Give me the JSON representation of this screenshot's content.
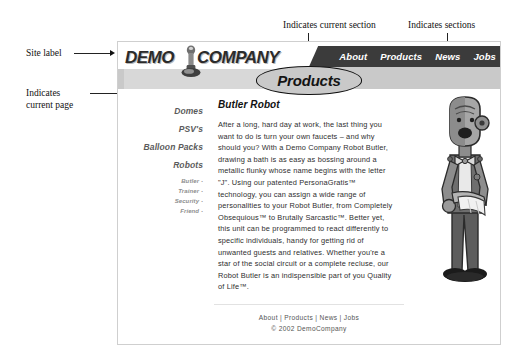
{
  "figure": {
    "annotations": [
      {
        "id": "site-label",
        "text": "Site label"
      },
      {
        "id": "current-page",
        "text": "Indicates\ncurrent page"
      },
      {
        "id": "current-section",
        "text": "Indicates current section"
      },
      {
        "id": "sections",
        "text": "Indicates sections"
      }
    ]
  },
  "site": {
    "logo": {
      "word1": "DEMO",
      "word2": "COMPANY",
      "icon": "robot-logo-icon"
    },
    "topnav": [
      {
        "label": "About",
        "current": false
      },
      {
        "label": "Products",
        "current": true
      },
      {
        "label": "News",
        "current": false
      },
      {
        "label": "Jobs",
        "current": false
      }
    ],
    "section_badge": "Products"
  },
  "sidebar": {
    "items": [
      {
        "label": "Domes",
        "level": "major"
      },
      {
        "label": "PSV's",
        "level": "major"
      },
      {
        "label": "Balloon Packs",
        "level": "major"
      },
      {
        "label": "Robots",
        "level": "major"
      }
    ],
    "subitems": [
      {
        "label": "Butler",
        "current": true
      },
      {
        "label": "Trainer",
        "current": false
      },
      {
        "label": "Security",
        "current": false
      },
      {
        "label": "Friend",
        "current": false
      }
    ]
  },
  "main": {
    "page_title": "Butler Robot",
    "body": "After a long, hard day at work, the last thing you want to do is turn your own faucets – and why should you? With a Demo Company Robot Butler, drawing a bath is as easy as bossing around a metallic flunky whose name begins with the letter \"J\". Using our patented PersonaGratis™ technology, you can assign a wide range of personalities to your Robot Butler, from Completely Obsequious™ to Brutally Sarcastic™. Better yet, this unit can be programmed to react differently to specific individuals, handy for getting rid of unwanted guests and relatives. Whether you're a star of the social circuit or a complete recluse, our Robot Butler is an indispensible part of you Quality of Life™.",
    "illustration": "robot-butler-illustration"
  },
  "footer": {
    "links": [
      "About",
      "Products",
      "News",
      "Jobs"
    ],
    "separator": " | ",
    "copyright": "© 2002 DemoCompany"
  },
  "colors": {
    "header_dark": "#3b3b3b",
    "header_grey": "#c9c9c9",
    "sidebar_major": "#5b5b5b",
    "sidebar_minor": "#8e8e8e",
    "page_bg": "#ffffff"
  }
}
